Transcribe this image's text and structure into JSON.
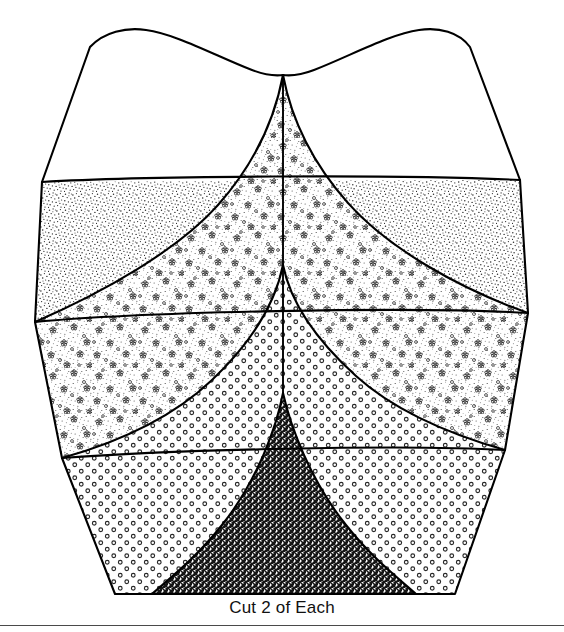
{
  "document": {
    "type": "sewing-pattern-template",
    "caption": "Cut 2 of Each",
    "background_color": "#ffffff",
    "ink_color": "#000000",
    "rule_color": "#4a4a4a"
  },
  "figure": {
    "name": "tulip-petal-pattern-piece",
    "center_seam_x": 283,
    "bottom_edge_y": 594,
    "pieces": [
      {
        "index": 0,
        "name": "plain-top-piece",
        "fill_label": "plain-white",
        "fill_color": "#ffffff",
        "apex_y": 75
      },
      {
        "index": 1,
        "name": "stipple-band-piece",
        "fill_label": "fine-stipple",
        "fill_color": "#e8e8e8",
        "apex_y": 75
      },
      {
        "index": 2,
        "name": "floral-band-piece",
        "fill_label": "floral-speckle",
        "fill_color": "#f4f4f4",
        "apex_y": 265
      },
      {
        "index": 3,
        "name": "circle-band-piece",
        "fill_label": "open-circle-grid",
        "fill_color": "#fafafa",
        "apex_y": 393
      },
      {
        "index": 4,
        "name": "crosshatch-center-piece",
        "fill_label": "dark-crosshatch",
        "fill_color": "#555555",
        "apex_y": 393
      }
    ],
    "outline": {
      "left_shoulder_x": 90,
      "left_peak_x": 145,
      "right_peak_x": 415,
      "right_shoulder_x": 470,
      "top_peak_y": 30,
      "notch_apex": {
        "x": 283,
        "y": 75
      },
      "bottom_left_x": 115,
      "bottom_right_x": 455
    }
  }
}
